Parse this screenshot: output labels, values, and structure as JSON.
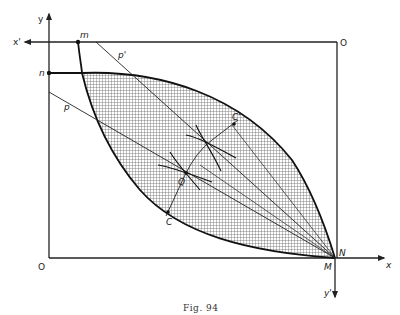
{
  "figure": {
    "caption": "Fig. 94",
    "labels": {
      "y_axis": "y",
      "x_prime_axis": "x'",
      "x_axis": "x",
      "y_prime_axis": "y'",
      "origin_top_right": "O",
      "origin_bottom_left": "O",
      "point_m": "m",
      "point_n": "n",
      "point_N": "N",
      "point_M": "M",
      "line_p": "p",
      "line_p_prime": "p'",
      "point_Q": "Q",
      "point_C": "C",
      "point_C_prime": "C'"
    },
    "colors": {
      "ink": "#222222",
      "hatch": "#555555",
      "background": "#ffffff"
    }
  }
}
